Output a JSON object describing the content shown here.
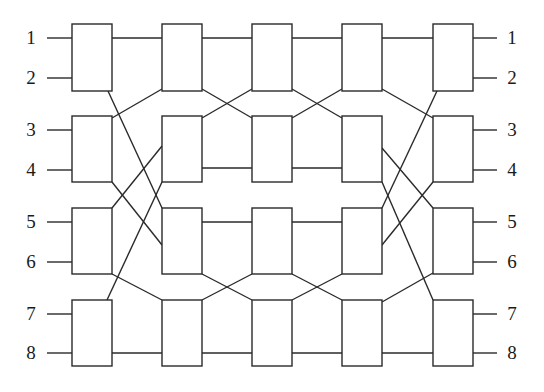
{
  "diagram": {
    "stroke_color": "#2a2a2a",
    "input_labels": [
      "1",
      "2",
      "3",
      "4",
      "5",
      "6",
      "7",
      "8"
    ],
    "output_labels": [
      "1",
      "2",
      "3",
      "4",
      "5",
      "6",
      "7",
      "8"
    ],
    "port_y": [
      38,
      78,
      130,
      170,
      222,
      262,
      314,
      353
    ],
    "columns": [
      {
        "x": 72,
        "w": 40,
        "boxes": [
          [
            24,
            91
          ],
          [
            116,
            182
          ],
          [
            208,
            274
          ],
          [
            300,
            366
          ]
        ]
      },
      {
        "x": 162,
        "w": 40,
        "boxes": [
          [
            24,
            91
          ],
          [
            116,
            182
          ],
          [
            208,
            274
          ],
          [
            300,
            366
          ]
        ]
      },
      {
        "x": 252,
        "w": 40,
        "boxes": [
          [
            24,
            91
          ],
          [
            116,
            182
          ],
          [
            208,
            274
          ],
          [
            300,
            366
          ]
        ]
      },
      {
        "x": 342,
        "w": 40,
        "boxes": [
          [
            24,
            91
          ],
          [
            116,
            182
          ],
          [
            208,
            274
          ],
          [
            300,
            366
          ]
        ]
      },
      {
        "x": 433,
        "w": 40,
        "boxes": [
          [
            24,
            91
          ],
          [
            116,
            182
          ],
          [
            208,
            274
          ],
          [
            300,
            366
          ]
        ]
      }
    ],
    "wires": [
      [
        47,
        38,
        72,
        38
      ],
      [
        47,
        78,
        72,
        78
      ],
      [
        47,
        130,
        72,
        130
      ],
      [
        47,
        170,
        72,
        170
      ],
      [
        47,
        222,
        72,
        222
      ],
      [
        47,
        262,
        72,
        262
      ],
      [
        47,
        314,
        72,
        314
      ],
      [
        47,
        353,
        72,
        353
      ],
      [
        112,
        38,
        162,
        38
      ],
      [
        108,
        91,
        162,
        208
      ],
      [
        112,
        118,
        162,
        89
      ],
      [
        112,
        182,
        162,
        245
      ],
      [
        112,
        208,
        162,
        146
      ],
      [
        112,
        274,
        162,
        300
      ],
      [
        107,
        300,
        162,
        182
      ],
      [
        112,
        353,
        162,
        353
      ],
      [
        202,
        38,
        252,
        38
      ],
      [
        202,
        89,
        252,
        118
      ],
      [
        202,
        118,
        252,
        89
      ],
      [
        202,
        168,
        252,
        168
      ],
      [
        202,
        222,
        252,
        222
      ],
      [
        202,
        274,
        252,
        300
      ],
      [
        202,
        300,
        252,
        274
      ],
      [
        202,
        353,
        252,
        353
      ],
      [
        292,
        38,
        342,
        38
      ],
      [
        292,
        89,
        342,
        118
      ],
      [
        292,
        118,
        342,
        89
      ],
      [
        292,
        168,
        342,
        168
      ],
      [
        292,
        222,
        342,
        222
      ],
      [
        292,
        274,
        342,
        300
      ],
      [
        292,
        300,
        342,
        274
      ],
      [
        292,
        353,
        342,
        353
      ],
      [
        382,
        38,
        433,
        38
      ],
      [
        382,
        89,
        433,
        118
      ],
      [
        437,
        91,
        382,
        208
      ],
      [
        382,
        148,
        433,
        208
      ],
      [
        382,
        182,
        433,
        300
      ],
      [
        382,
        245,
        433,
        182
      ],
      [
        382,
        302,
        433,
        273
      ],
      [
        382,
        353,
        433,
        353
      ],
      [
        473,
        38,
        497,
        38
      ],
      [
        473,
        78,
        497,
        78
      ],
      [
        473,
        130,
        497,
        130
      ],
      [
        473,
        170,
        497,
        170
      ],
      [
        473,
        222,
        497,
        222
      ],
      [
        473,
        262,
        497,
        262
      ],
      [
        473,
        314,
        497,
        314
      ],
      [
        473,
        353,
        497,
        353
      ]
    ]
  }
}
